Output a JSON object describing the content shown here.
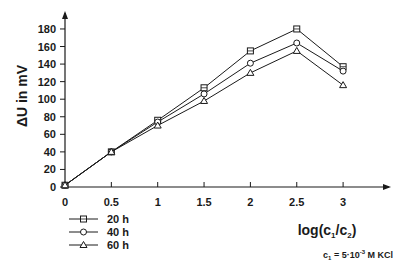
{
  "chart_data": {
    "type": "line",
    "title": "",
    "xlabel": "log(c1/c2)",
    "ylabel": "ΔU in mV",
    "xlim": [
      0,
      3.3
    ],
    "ylim": [
      0,
      190
    ],
    "x_ticks": [
      "0",
      "0.5",
      "1",
      "1.5",
      "2",
      "2.5",
      "3"
    ],
    "y_ticks": [
      "0",
      "20",
      "40",
      "60",
      "80",
      "100",
      "120",
      "140",
      "160",
      "180"
    ],
    "x": [
      0,
      0.5,
      1,
      1.5,
      2,
      2.5,
      3
    ],
    "series": [
      {
        "name": "20 h",
        "marker": "square",
        "values": [
          2,
          40,
          76,
          113,
          155,
          180,
          137
        ]
      },
      {
        "name": "40 h",
        "marker": "circle",
        "values": [
          2,
          40,
          74,
          106,
          141,
          164,
          132
        ]
      },
      {
        "name": "60 h",
        "marker": "triangle",
        "values": [
          2,
          40,
          70,
          98,
          130,
          155,
          116
        ]
      }
    ],
    "grid": false,
    "legend_position": "bottom-left",
    "annotations": [
      "c1 = 5·10^-3 M KCl"
    ]
  },
  "axes": {
    "y_title_main": "ΔU in mV",
    "x_title_prefix": "log(c",
    "x_title_sub1": "1",
    "x_title_mid": "/c",
    "x_title_sub2": "2",
    "x_title_suffix": ")"
  },
  "legend": {
    "items": [
      {
        "label": "20 h",
        "marker": "square"
      },
      {
        "label": "40 h",
        "marker": "circle"
      },
      {
        "label": "60 h",
        "marker": "triangle"
      }
    ]
  },
  "note": {
    "prefix": "c",
    "sub": "1",
    "eq": " = 5·10",
    "sup": "-3",
    "suffix": "  M KCl"
  },
  "colors": {
    "ink": "#1a1a1a",
    "background": "#ffffff"
  }
}
